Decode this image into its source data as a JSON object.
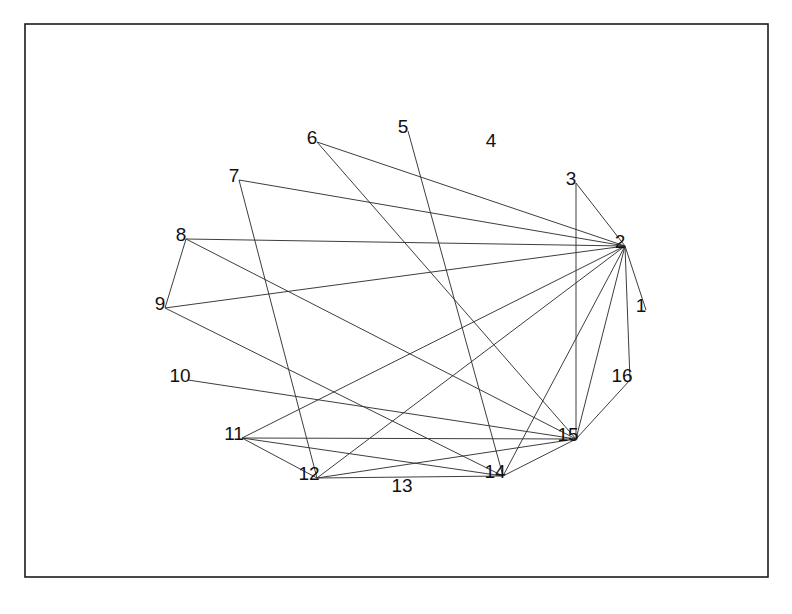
{
  "figure": {
    "title": "",
    "background_color": "#ffffff",
    "frame": {
      "x": 25,
      "y": 24,
      "width": 743,
      "height": 553,
      "stroke_color": "#1b1b1b",
      "fill_color": "#ffffff"
    }
  },
  "chart_data": {
    "type": "diagram",
    "subtype": "node-link-graph",
    "title": "",
    "xlabel": "",
    "ylabel": "",
    "grid": false,
    "legend": null,
    "edge_color": "#333333",
    "label_color": "#111111",
    "node_count": 16,
    "edge_count": 26,
    "nodes": [
      {
        "id": 1,
        "label": "1",
        "x": 641,
        "y": 305,
        "degree": 1
      },
      {
        "id": 2,
        "label": "2",
        "x": 620,
        "y": 241,
        "degree": 13
      },
      {
        "id": 3,
        "label": "3",
        "x": 571,
        "y": 178,
        "degree": 2
      },
      {
        "id": 4,
        "label": "4",
        "x": 491,
        "y": 140,
        "degree": 0
      },
      {
        "id": 5,
        "label": "5",
        "x": 403,
        "y": 126,
        "degree": 1
      },
      {
        "id": 6,
        "label": "6",
        "x": 312,
        "y": 137,
        "degree": 2
      },
      {
        "id": 7,
        "label": "7",
        "x": 234,
        "y": 175,
        "degree": 2
      },
      {
        "id": 8,
        "label": "8",
        "x": 181,
        "y": 234,
        "degree": 3
      },
      {
        "id": 9,
        "label": "9",
        "x": 160,
        "y": 303,
        "degree": 3
      },
      {
        "id": 10,
        "label": "10",
        "x": 180,
        "y": 375,
        "degree": 1
      },
      {
        "id": 11,
        "label": "11",
        "x": 234,
        "y": 433,
        "degree": 5
      },
      {
        "id": 12,
        "label": "12",
        "x": 309,
        "y": 473,
        "degree": 5
      },
      {
        "id": 13,
        "label": "13",
        "x": 402,
        "y": 485,
        "degree": 0
      },
      {
        "id": 14,
        "label": "14",
        "x": 495,
        "y": 471,
        "degree": 6
      },
      {
        "id": 15,
        "label": "15",
        "x": 568,
        "y": 434,
        "degree": 9
      },
      {
        "id": 16,
        "label": "16",
        "x": 622,
        "y": 375,
        "degree": 2
      }
    ],
    "edges": [
      {
        "source": 1,
        "target": 2
      },
      {
        "source": 2,
        "target": 3
      },
      {
        "source": 2,
        "target": 6
      },
      {
        "source": 2,
        "target": 7
      },
      {
        "source": 2,
        "target": 8
      },
      {
        "source": 2,
        "target": 9
      },
      {
        "source": 2,
        "target": 11
      },
      {
        "source": 2,
        "target": 12
      },
      {
        "source": 2,
        "target": 14
      },
      {
        "source": 2,
        "target": 15
      },
      {
        "source": 2,
        "target": 16
      },
      {
        "source": 3,
        "target": 15
      },
      {
        "source": 5,
        "target": 14
      },
      {
        "source": 6,
        "target": 15
      },
      {
        "source": 7,
        "target": 12
      },
      {
        "source": 8,
        "target": 9
      },
      {
        "source": 8,
        "target": 15
      },
      {
        "source": 9,
        "target": 14
      },
      {
        "source": 10,
        "target": 15
      },
      {
        "source": 11,
        "target": 12
      },
      {
        "source": 11,
        "target": 14
      },
      {
        "source": 11,
        "target": 15
      },
      {
        "source": 12,
        "target": 14
      },
      {
        "source": 12,
        "target": 15
      },
      {
        "source": 14,
        "target": 15
      },
      {
        "source": 15,
        "target": 16
      }
    ]
  }
}
